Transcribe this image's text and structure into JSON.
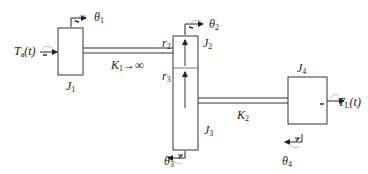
{
  "diagram": {
    "type": "mechanical gear train",
    "components": {
      "J1": {
        "label": "J",
        "sub": "1",
        "angle": {
          "label": "θ",
          "sub": "1"
        }
      },
      "J2": {
        "label": "J",
        "sub": "2",
        "radius": {
          "label": "r",
          "sub": "2"
        },
        "angle": {
          "label": "θ",
          "sub": "2"
        }
      },
      "J3": {
        "label": "J",
        "sub": "3",
        "radius": {
          "label": "r",
          "sub": "3"
        },
        "angle": {
          "label": "θ",
          "sub": "3"
        }
      },
      "J4": {
        "label": "J",
        "sub": "4",
        "angle": {
          "label": "θ",
          "sub": "4"
        }
      }
    },
    "shafts": {
      "K1": {
        "label": "K",
        "sub": "1",
        "suffix": "→∞"
      },
      "K2": {
        "label": "K",
        "sub": "2"
      }
    },
    "torques": {
      "input": {
        "label": "T",
        "sub": "a",
        "arg": "(t)"
      },
      "load": {
        "label": "T",
        "sub": "L",
        "arg": "(t)"
      }
    },
    "colors": {
      "line": "#333333",
      "background": "#ffffff"
    }
  }
}
